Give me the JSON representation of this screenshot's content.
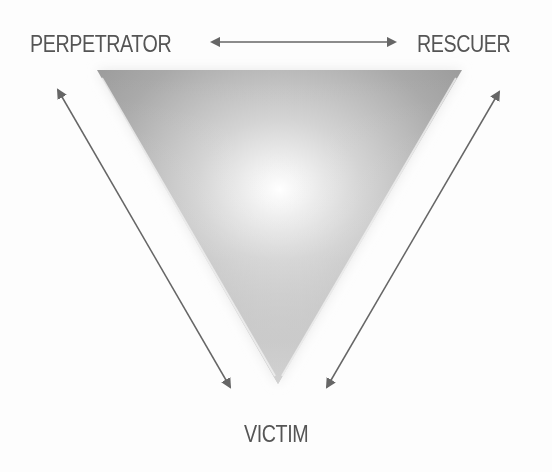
{
  "diagram": {
    "nodes": [
      {
        "id": "perpetrator",
        "label": "PERPETRATOR",
        "position": "top-left"
      },
      {
        "id": "rescuer",
        "label": "RESCUER",
        "position": "top-right"
      },
      {
        "id": "victim",
        "label": "VICTIM",
        "position": "bottom"
      }
    ],
    "edges": [
      {
        "from": "perpetrator",
        "to": "rescuer",
        "type": "bidirectional-arrow"
      },
      {
        "from": "perpetrator",
        "to": "victim",
        "type": "bidirectional-arrow"
      },
      {
        "from": "rescuer",
        "to": "victim",
        "type": "bidirectional-arrow"
      }
    ],
    "shape": "inverted-triangle-gradient"
  },
  "labels": {
    "perpetrator": "PERPETRATOR",
    "rescuer": "RESCUER",
    "victim": "VICTIM"
  },
  "colors": {
    "text": "#555555",
    "arrow": "#666666",
    "triangle_dark": "#9a9a9a",
    "background": "#fdfdfd"
  }
}
